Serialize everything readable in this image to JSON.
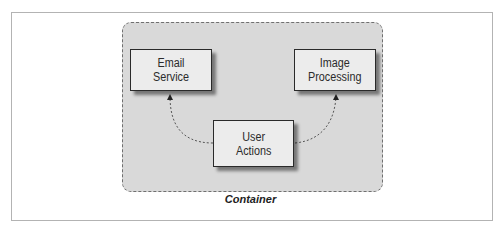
{
  "diagram": {
    "container": {
      "label": "Container"
    },
    "nodes": [
      {
        "id": "email",
        "label_line1": "Email",
        "label_line2": "Service"
      },
      {
        "id": "image",
        "label_line1": "Image",
        "label_line2": "Processing"
      },
      {
        "id": "user",
        "label_line1": "User",
        "label_line2": "Actions"
      }
    ],
    "edges": [
      {
        "from": "User Actions",
        "to": "Email Service",
        "style": "dashed-curve"
      },
      {
        "from": "User Actions",
        "to": "Image Processing",
        "style": "dashed-curve"
      }
    ],
    "colors": {
      "container_fill": "#d9d9d9",
      "node_fill": "#ececec",
      "node_border": "#2a2a2a",
      "frame_border": "#b3b3b3"
    }
  }
}
